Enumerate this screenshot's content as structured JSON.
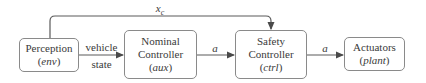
{
  "diagram": {
    "type": "block-diagram",
    "blocks": [
      {
        "id": "perception",
        "line1": "Perception",
        "line2": "",
        "var": "env"
      },
      {
        "id": "nominal",
        "line1": "Nominal",
        "line2": "Controller",
        "var": "aux"
      },
      {
        "id": "safety",
        "line1": "Safety",
        "line2": "Controller",
        "var": "ctrl"
      },
      {
        "id": "actuators",
        "line1": "Actuators",
        "line2": "",
        "var": "plant"
      }
    ],
    "edges": {
      "perception_to_nominal": {
        "top": "vehicle",
        "bottom": "state"
      },
      "nominal_to_safety": {
        "label": "a"
      },
      "safety_to_actuators": {
        "label": "a"
      },
      "perception_to_safety": {
        "label_base": "x",
        "label_sub": "c"
      }
    },
    "colors": {
      "stroke": "#5a5a5a",
      "box_border": "#8a8a8a",
      "text": "#3a3a3a"
    }
  }
}
